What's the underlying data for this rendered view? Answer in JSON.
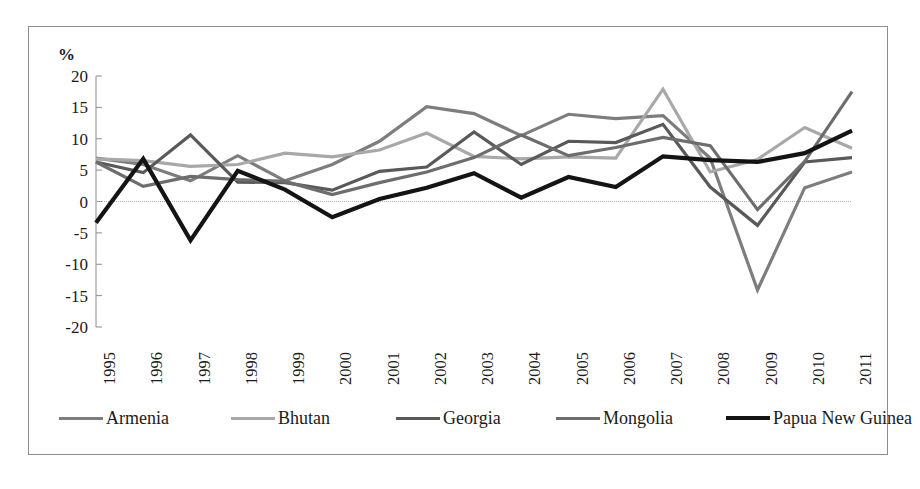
{
  "chart_data": {
    "type": "line",
    "title": "",
    "subtitle": "",
    "xlabel": "",
    "ylabel": "%",
    "ylim": [
      -20,
      20
    ],
    "yticks": [
      20,
      15,
      10,
      5,
      0,
      -5,
      -10,
      -15,
      -20
    ],
    "ytick_labels": [
      "20",
      "15",
      "10",
      "5",
      "0",
      "-5",
      "-10",
      "-15",
      "-20"
    ],
    "grid": false,
    "zero_line": true,
    "legend_position": "bottom",
    "categories": [
      1995,
      1996,
      1997,
      1998,
      1999,
      2000,
      2001,
      2002,
      2003,
      2004,
      2005,
      2006,
      2007,
      2008,
      2009,
      2010,
      2011
    ],
    "xtick_labels": [
      "1995",
      "1996",
      "1997",
      "1998",
      "1999",
      "2000",
      "2001",
      "2002",
      "2003",
      "2004",
      "2005",
      "2006",
      "2007",
      "2008",
      "2009",
      "2010",
      "2011"
    ],
    "series": [
      {
        "name": "Armenia",
        "color": "#7d7d7d",
        "width": 3.2,
        "values": [
          6.9,
          5.9,
          3.3,
          7.3,
          3.3,
          5.9,
          9.6,
          15.1,
          14.0,
          10.5,
          13.9,
          13.2,
          13.7,
          6.9,
          -14.1,
          2.2,
          4.7
        ]
      },
      {
        "name": "Bhutan",
        "color": "#a8a8a8",
        "width": 3.2,
        "values": [
          6.8,
          6.5,
          5.6,
          5.9,
          7.7,
          7.1,
          8.2,
          10.9,
          7.2,
          6.8,
          7.1,
          6.9,
          17.9,
          4.7,
          6.7,
          11.8,
          8.5
        ]
      },
      {
        "name": "Georgia",
        "color": "#595959",
        "width": 3.2,
        "values": [
          6.3,
          4.6,
          10.6,
          3.1,
          3.0,
          1.8,
          4.8,
          5.5,
          11.1,
          5.9,
          9.6,
          9.4,
          12.3,
          2.3,
          -3.8,
          6.3,
          7.0
        ]
      },
      {
        "name": "Mongolia",
        "color": "#6d6d6d",
        "width": 3.2,
        "values": [
          6.3,
          2.4,
          4.0,
          3.5,
          3.2,
          1.1,
          3.0,
          4.7,
          7.0,
          10.6,
          7.3,
          8.6,
          10.2,
          8.9,
          -1.3,
          6.4,
          17.5
        ]
      },
      {
        "name": "Papua New Guinea",
        "color": "#141414",
        "width": 4.2,
        "values": [
          -3.4,
          6.8,
          -6.2,
          4.9,
          1.9,
          -2.5,
          0.4,
          2.2,
          4.5,
          0.6,
          3.9,
          2.3,
          7.2,
          6.6,
          6.3,
          7.7,
          11.3
        ]
      }
    ]
  },
  "legend": {
    "items": [
      {
        "label": "Armenia"
      },
      {
        "label": "Bhutan"
      },
      {
        "label": "Georgia"
      },
      {
        "label": "Mongolia"
      },
      {
        "label": "Papua New Guinea"
      }
    ]
  }
}
